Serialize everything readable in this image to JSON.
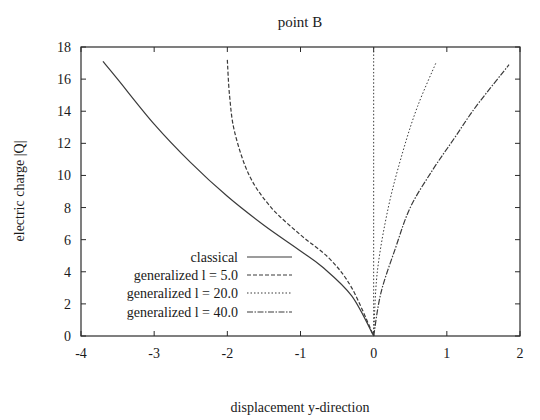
{
  "chart_data": {
    "type": "line",
    "title": "point B",
    "xlabel": "displacement y-direction",
    "ylabel": "electric charge |Q|",
    "xlim": [
      -4,
      2
    ],
    "ylim": [
      0,
      18
    ],
    "xticks": [
      -4,
      -3,
      -2,
      -1,
      0,
      1,
      2
    ],
    "yticks": [
      0,
      2,
      4,
      6,
      8,
      10,
      12,
      14,
      16,
      18
    ],
    "grid": false,
    "legend_position": "lower left",
    "series": [
      {
        "name": "classical",
        "style": "solid",
        "x": [
          -3.7,
          -3.5,
          -3.0,
          -2.5,
          -2.0,
          -1.5,
          -1.0,
          -0.7,
          -0.3,
          0.0
        ],
        "y": [
          17.1,
          16.0,
          13.2,
          10.8,
          8.7,
          6.9,
          5.3,
          4.3,
          2.5,
          0.0
        ]
      },
      {
        "name": "generalized l = 5.0",
        "style": "dashed",
        "x": [
          -2.0,
          -1.97,
          -1.9,
          -1.7,
          -1.4,
          -1.0,
          -0.6,
          -0.3,
          0.0
        ],
        "y": [
          17.2,
          15.0,
          12.7,
          10.0,
          8.0,
          6.3,
          4.8,
          3.0,
          0.0
        ]
      },
      {
        "name": "generalized l = 20.0",
        "style": "dotted",
        "x": [
          0.0,
          0.0
        ],
        "y": [
          0.0,
          18.0
        ]
      },
      {
        "name": "generalized l = 40.0",
        "style": "dash-dot",
        "x": [
          0.0,
          0.1,
          0.3,
          0.5,
          0.8,
          1.1,
          1.4,
          1.85
        ],
        "y": [
          0.0,
          2.7,
          5.5,
          8.0,
          10.3,
          12.3,
          14.3,
          16.9
        ]
      },
      {
        "name": "right-branch dotted",
        "style": "dotted",
        "x": [
          0.0,
          0.05,
          0.2,
          0.4,
          0.6,
          0.85
        ],
        "y": [
          0.0,
          4.0,
          8.0,
          11.5,
          14.3,
          17.0
        ]
      }
    ]
  },
  "legend": {
    "items": [
      {
        "label": "classical"
      },
      {
        "label": "generalized l = 5.0"
      },
      {
        "label": "generalized l = 20.0"
      },
      {
        "label": "generalized l = 40.0"
      }
    ]
  },
  "colors": {
    "axis": "#2a2a2a",
    "line": "#3a3a3a"
  }
}
